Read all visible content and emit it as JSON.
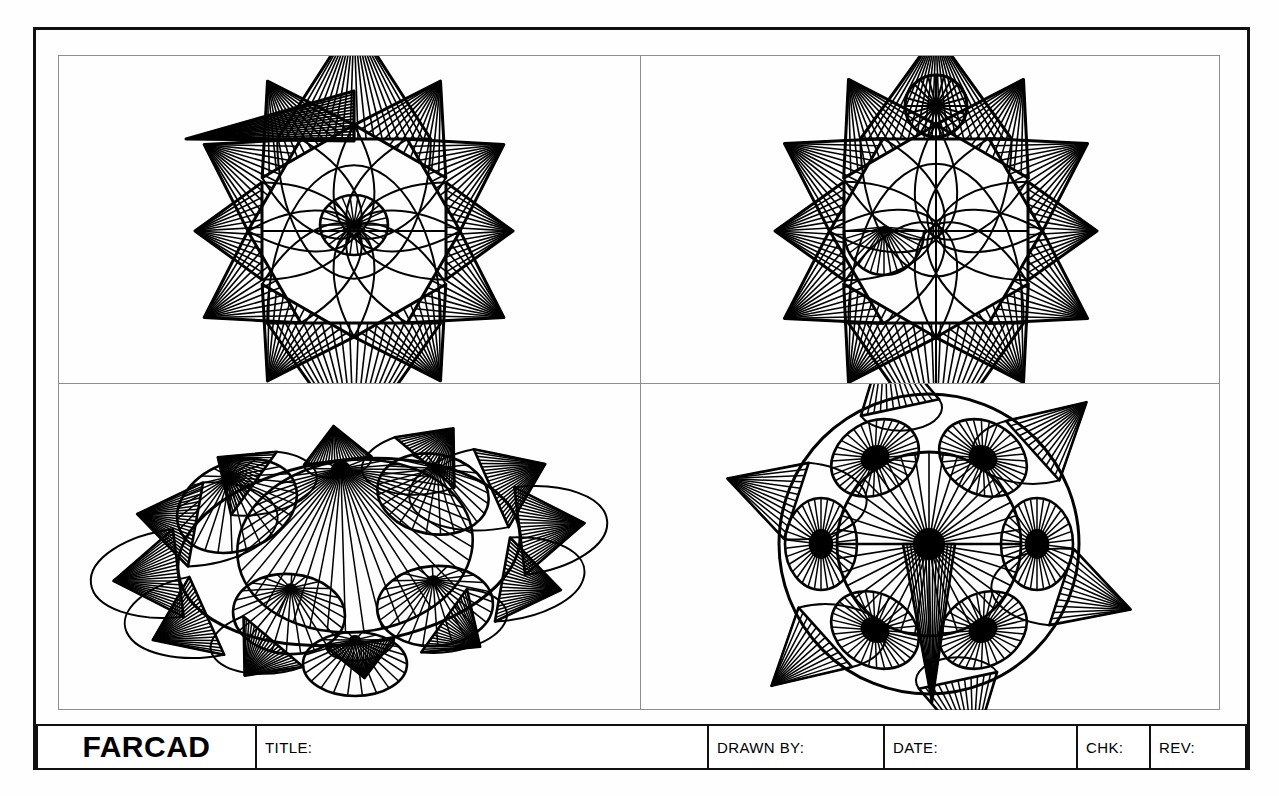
{
  "sheet": {
    "background": "#fefefe",
    "ink": "#000000",
    "border_color": "#111111",
    "frame_color": "#8e8e8e"
  },
  "title_block": {
    "logo": "FARCAD",
    "fields": [
      {
        "key": "title",
        "label": "TITLE:",
        "value": ""
      },
      {
        "key": "drawn_by",
        "label": "DRAWN  BY:",
        "value": ""
      },
      {
        "key": "date",
        "label": "DATE:",
        "value": ""
      },
      {
        "key": "chk",
        "label": "CHK:",
        "value": ""
      },
      {
        "key": "rev",
        "label": "REV:",
        "value": ""
      }
    ]
  },
  "drawing": {
    "subject": "spiked-ball-wireframe",
    "view_count": 4,
    "views": [
      {
        "id": "top-left",
        "name": "front-view",
        "label": ""
      },
      {
        "id": "top-right",
        "name": "side-view",
        "label": ""
      },
      {
        "id": "bottom-left",
        "name": "isometric-view",
        "label": ""
      },
      {
        "id": "bottom-right",
        "name": "top-view",
        "label": ""
      }
    ]
  },
  "geometry": {
    "front_view": {
      "center": [
        295,
        175
      ],
      "body_radius": 92,
      "cone_length": 85,
      "cone_half_angle": 17,
      "spike_angles_deg": [
        0,
        30,
        60,
        90,
        120,
        150,
        180,
        210,
        240,
        270,
        300,
        330
      ],
      "flag_spike": {
        "angle_deg": 196,
        "length": 178,
        "half_angle": 7
      },
      "ray_count": 19
    },
    "side_view": {
      "center": [
        295,
        175
      ],
      "body_radius": 92,
      "cone_length": 85,
      "cone_half_angle": 17,
      "spike_angles_deg": [
        0,
        30,
        60,
        90,
        120,
        150,
        180,
        210,
        240,
        270,
        300,
        330
      ],
      "head_circle": {
        "cx": 295,
        "cy": 50,
        "r": 31,
        "spokes": 24
      },
      "ray_count": 19
    },
    "iso_view": {
      "center": [
        290,
        168
      ],
      "ellipse_rx": 172,
      "ellipse_ry": 92,
      "tilt_deg": -7,
      "cone_count": 12,
      "ray_count": 22
    },
    "top_view": {
      "center": [
        288,
        160
      ],
      "outer_radius": 150,
      "inner_radius": 92,
      "satellite_count": 6,
      "satellite_orbit": 108,
      "satellite_rx": 46,
      "satellite_ry": 36,
      "hub_spokes": 40,
      "satellite_spokes": 34,
      "spike_count": 6
    }
  }
}
